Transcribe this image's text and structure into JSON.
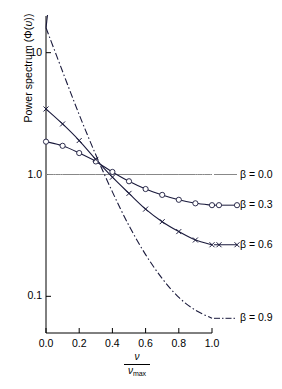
{
  "figure": {
    "background": "#ffffff",
    "axis_color": "#000000",
    "curve_color": "#1a1a3c",
    "reference_line_color": "#888888"
  },
  "axes": {
    "y_axis_title_prefix": "Power spectrum (",
    "y_axis_title_phi": "Φ(",
    "y_axis_title_nu": "υ",
    "y_axis_title_suffix": "))",
    "x_axis_numerator": "ν",
    "x_axis_denominator": "ν",
    "x_axis_denominator_sub": "max",
    "y_ticks": [
      "10",
      "1.0",
      "0.1"
    ],
    "y_tick_values": [
      10,
      1.0,
      0.1
    ],
    "x_ticks": [
      "0.0",
      "0.2",
      "0.4",
      "0.6",
      "0.8",
      "1.0"
    ],
    "x_tick_values": [
      0.0,
      0.2,
      0.4,
      0.6,
      0.8,
      1.0
    ]
  },
  "legend": {
    "entries": [
      {
        "label": "β = 0.0",
        "beta": "0.0",
        "style": "solid",
        "marker": "none"
      },
      {
        "label": "β = 0.3",
        "beta": "0.3",
        "style": "solid",
        "marker": "circle"
      },
      {
        "label": "β = 0.6",
        "beta": "0.6",
        "style": "solid",
        "marker": "cross"
      },
      {
        "label": "β = 0.9",
        "beta": "0.9",
        "style": "dashdot",
        "marker": "none"
      }
    ]
  },
  "chart_data": {
    "type": "line",
    "title": "",
    "xlabel": "ν / ν_max",
    "ylabel": "Power spectrum (Φ(υ))",
    "yscale": "log",
    "xscale": "linear",
    "xlim": [
      0.0,
      1.0
    ],
    "ylim": [
      0.05,
      20.0
    ],
    "grid": false,
    "legend_position": "right-outside",
    "x": [
      0.0,
      0.1,
      0.2,
      0.3,
      0.4,
      0.5,
      0.6,
      0.7,
      0.8,
      0.9,
      1.0
    ],
    "series": [
      {
        "name": "β = 0.0",
        "beta": 0.0,
        "linestyle": "solid",
        "marker": "none",
        "color": "#888888",
        "values": [
          1.0,
          1.0,
          1.0,
          1.0,
          1.0,
          1.0,
          1.0,
          1.0,
          1.0,
          1.0,
          1.0
        ]
      },
      {
        "name": "β = 0.3",
        "beta": 0.3,
        "linestyle": "solid",
        "marker": "circle",
        "color": "#1a1a3c",
        "values": [
          1.86,
          1.72,
          1.5,
          1.28,
          1.05,
          0.88,
          0.76,
          0.68,
          0.62,
          0.58,
          0.56
        ]
      },
      {
        "name": "β = 0.6",
        "beta": 0.6,
        "linestyle": "solid",
        "marker": "cross",
        "color": "#1a1a3c",
        "values": [
          3.45,
          2.6,
          1.9,
          1.33,
          0.95,
          0.7,
          0.52,
          0.41,
          0.34,
          0.29,
          0.265
        ]
      },
      {
        "name": "β = 0.9",
        "beta": 0.9,
        "linestyle": "dashdot",
        "marker": "none",
        "color": "#1a1a3c",
        "values": [
          16.0,
          7.0,
          3.1,
          1.45,
          0.72,
          0.38,
          0.22,
          0.14,
          0.098,
          0.077,
          0.066
        ]
      }
    ]
  }
}
